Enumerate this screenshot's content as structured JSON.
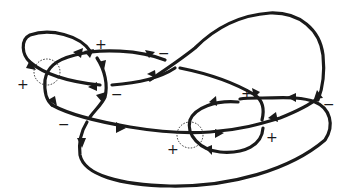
{
  "diagram": {
    "type": "oriented knot diagram with signed crossings",
    "crossing_signs": [
      {
        "label": "+",
        "x": 101,
        "y": 45
      },
      {
        "label": "−",
        "x": 165,
        "y": 54
      },
      {
        "label": "+",
        "x": 23,
        "y": 85
      },
      {
        "label": "−",
        "x": 117,
        "y": 95
      },
      {
        "label": "−",
        "x": 65,
        "y": 125
      },
      {
        "label": "+",
        "x": 247,
        "y": 94
      },
      {
        "label": "−",
        "x": 330,
        "y": 105
      },
      {
        "label": "+",
        "x": 272,
        "y": 138
      },
      {
        "label": "+",
        "x": 173,
        "y": 150
      }
    ],
    "dotted_circles": [
      {
        "cx": 47,
        "cy": 72,
        "r": 13
      },
      {
        "cx": 190,
        "cy": 135,
        "r": 13
      }
    ]
  }
}
